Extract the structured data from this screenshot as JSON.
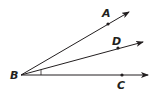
{
  "diagram": {
    "type": "angle-rays",
    "vertex": {
      "label": "B",
      "x": 21,
      "y": 75
    },
    "rays": [
      {
        "name": "BA",
        "end": {
          "x": 129,
          "y": 12
        },
        "point": {
          "label": "A",
          "x": 108,
          "y": 24
        }
      },
      {
        "name": "BD",
        "end": {
          "x": 143,
          "y": 42
        },
        "point": {
          "label": "D",
          "x": 118,
          "y": 48
        }
      },
      {
        "name": "BC",
        "end": {
          "x": 148,
          "y": 75
        },
        "point": {
          "label": "C",
          "x": 122,
          "y": 75
        }
      }
    ],
    "angle_mark": "angle DBC",
    "stroke_color": "#231f20"
  }
}
